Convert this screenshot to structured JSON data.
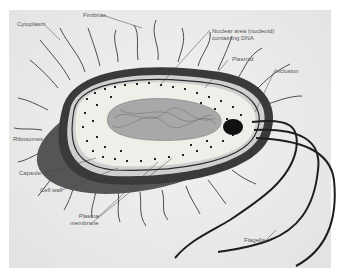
{
  "diagram": {
    "labels": {
      "fimbriae": "Fimbriae",
      "cytoplasm": "Cytoplasm",
      "nucleoid_line1": "Nuclear area (nucleoid)",
      "nucleoid_line2": "containing DNA",
      "plasmid": "Plasmid",
      "inclusion": "Inclusion",
      "ribosomes": "Ribosomes",
      "capsule": "Capsule",
      "cell_wall": "Cell wall",
      "plasma_membrane_line1": "Plasma",
      "plasma_membrane_line2": "membrane",
      "flagella": "Flagella"
    },
    "colors": {
      "capsule": "#3a3a3a",
      "capsule_shadow": "#555555",
      "cell_wall": "#cfcfcf",
      "cytoplasm": "#efefea",
      "nucleoid": "#9a9a9a",
      "inclusion": "#111111",
      "label_text": "#555555",
      "background": "#e9e9e9"
    }
  }
}
